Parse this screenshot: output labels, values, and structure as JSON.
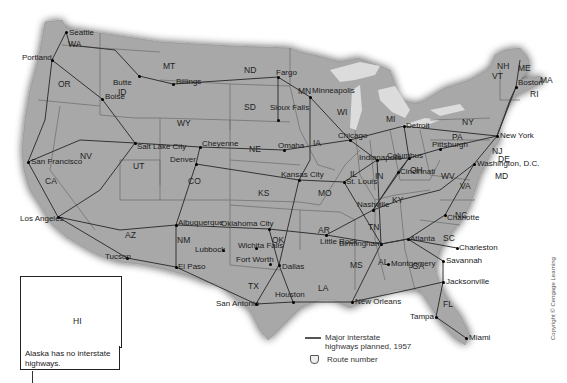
{
  "map": {
    "title": "Major interstate highways planned, 1957",
    "land_color": "#a8a8a8",
    "water_color": "#ffffff",
    "lakes_color": "#d8d8d8",
    "road_color": "#3a3a3a",
    "border_color": "#6a6a6a",
    "states": [
      {
        "abbr": "WA",
        "x": 68,
        "y": 40
      },
      {
        "abbr": "OR",
        "x": 58,
        "y": 80
      },
      {
        "abbr": "ID",
        "x": 118,
        "y": 88
      },
      {
        "abbr": "MT",
        "x": 163,
        "y": 62
      },
      {
        "abbr": "WY",
        "x": 177,
        "y": 119
      },
      {
        "abbr": "ND",
        "x": 244,
        "y": 66
      },
      {
        "abbr": "SD",
        "x": 244,
        "y": 103
      },
      {
        "abbr": "MN",
        "x": 298,
        "y": 87
      },
      {
        "abbr": "WI",
        "x": 337,
        "y": 108
      },
      {
        "abbr": "MI",
        "x": 386,
        "y": 115
      },
      {
        "abbr": "NV",
        "x": 80,
        "y": 152
      },
      {
        "abbr": "UT",
        "x": 133,
        "y": 162
      },
      {
        "abbr": "CO",
        "x": 188,
        "y": 177
      },
      {
        "abbr": "NE",
        "x": 249,
        "y": 145
      },
      {
        "abbr": "IA",
        "x": 313,
        "y": 139
      },
      {
        "abbr": "KS",
        "x": 258,
        "y": 189
      },
      {
        "abbr": "MO",
        "x": 318,
        "y": 189
      },
      {
        "abbr": "IL",
        "x": 350,
        "y": 170
      },
      {
        "abbr": "IN",
        "x": 375,
        "y": 172
      },
      {
        "abbr": "OH",
        "x": 410,
        "y": 166
      },
      {
        "abbr": "PA",
        "x": 452,
        "y": 133
      },
      {
        "abbr": "NY",
        "x": 462,
        "y": 118
      },
      {
        "abbr": "CA",
        "x": 45,
        "y": 177
      },
      {
        "abbr": "AZ",
        "x": 125,
        "y": 231
      },
      {
        "abbr": "NM",
        "x": 177,
        "y": 236
      },
      {
        "abbr": "OK",
        "x": 272,
        "y": 236
      },
      {
        "abbr": "TX",
        "x": 248,
        "y": 282
      },
      {
        "abbr": "AR",
        "x": 318,
        "y": 226
      },
      {
        "abbr": "LA",
        "x": 318,
        "y": 284
      },
      {
        "abbr": "MS",
        "x": 350,
        "y": 261
      },
      {
        "abbr": "AL",
        "x": 378,
        "y": 258
      },
      {
        "abbr": "GA",
        "x": 412,
        "y": 262
      },
      {
        "abbr": "TN",
        "x": 368,
        "y": 223
      },
      {
        "abbr": "KY",
        "x": 392,
        "y": 196
      },
      {
        "abbr": "WV",
        "x": 441,
        "y": 172
      },
      {
        "abbr": "VA",
        "x": 460,
        "y": 182
      },
      {
        "abbr": "NC",
        "x": 455,
        "y": 211
      },
      {
        "abbr": "SC",
        "x": 443,
        "y": 234
      },
      {
        "abbr": "FL",
        "x": 443,
        "y": 300
      },
      {
        "abbr": "NJ",
        "x": 492,
        "y": 147
      },
      {
        "abbr": "DE",
        "x": 498,
        "y": 155
      },
      {
        "abbr": "MD",
        "x": 495,
        "y": 172
      },
      {
        "abbr": "VT",
        "x": 492,
        "y": 72
      },
      {
        "abbr": "NH",
        "x": 497,
        "y": 62
      },
      {
        "abbr": "ME",
        "x": 518,
        "y": 64
      },
      {
        "abbr": "MA",
        "x": 540,
        "y": 76
      },
      {
        "abbr": "RI",
        "x": 530,
        "y": 90
      },
      {
        "abbr": "HI",
        "x": 73,
        "y": 321
      }
    ],
    "cities": [
      {
        "name": "Seattle",
        "x": 66,
        "y": 32,
        "dx": 3,
        "dy": -3
      },
      {
        "name": "Portland",
        "x": 52,
        "y": 60,
        "dx": -30,
        "dy": -6
      },
      {
        "name": "Boise",
        "x": 102,
        "y": 99,
        "dx": 3,
        "dy": -6
      },
      {
        "name": "Butte",
        "x": 139,
        "y": 76,
        "dx": -26,
        "dy": 3
      },
      {
        "name": "Billings",
        "x": 173,
        "y": 84,
        "dx": 3,
        "dy": -6
      },
      {
        "name": "Fargo",
        "x": 278,
        "y": 77,
        "dx": -2,
        "dy": -8
      },
      {
        "name": "Minneapolis",
        "x": 310,
        "y": 97,
        "dx": 2,
        "dy": -10
      },
      {
        "name": "Sioux Falls",
        "x": 278,
        "y": 120,
        "dx": -8,
        "dy": -16
      },
      {
        "name": "Salt Lake City",
        "x": 135,
        "y": 143,
        "dx": 2,
        "dy": 0
      },
      {
        "name": "Cheyenne",
        "x": 200,
        "y": 147,
        "dx": 2,
        "dy": -7
      },
      {
        "name": "Omaha",
        "x": 284,
        "y": 150,
        "dx": -6,
        "dy": -8
      },
      {
        "name": "Denver",
        "x": 196,
        "y": 164,
        "dx": -26,
        "dy": -8
      },
      {
        "name": "San Francisco",
        "x": 28,
        "y": 162,
        "dx": 3,
        "dy": -4
      },
      {
        "name": "Kansas City",
        "x": 299,
        "y": 180,
        "dx": -18,
        "dy": -9
      },
      {
        "name": "Chicago",
        "x": 350,
        "y": 140,
        "dx": -12,
        "dy": -8
      },
      {
        "name": "Detroit",
        "x": 404,
        "y": 126,
        "dx": 2,
        "dy": -4
      },
      {
        "name": "Indianapolis",
        "x": 377,
        "y": 160,
        "dx": -18,
        "dy": -6
      },
      {
        "name": "Columbus",
        "x": 409,
        "y": 158,
        "dx": -22,
        "dy": -6
      },
      {
        "name": "Cincinnati",
        "x": 398,
        "y": 172,
        "dx": 2,
        "dy": -4
      },
      {
        "name": "St. Louis",
        "x": 344,
        "y": 182,
        "dx": 2,
        "dy": -4
      },
      {
        "name": "Pittsburgh",
        "x": 440,
        "y": 149,
        "dx": -8,
        "dy": -8
      },
      {
        "name": "New York",
        "x": 497,
        "y": 136,
        "dx": 3,
        "dy": -4
      },
      {
        "name": "Boston",
        "x": 516,
        "y": 87,
        "dx": 2,
        "dy": -8
      },
      {
        "name": "Washington, D.C.",
        "x": 474,
        "y": 164,
        "dx": 3,
        "dy": -4
      },
      {
        "name": "Los Angeles",
        "x": 58,
        "y": 217,
        "dx": -38,
        "dy": -2
      },
      {
        "name": "Albuquerque",
        "x": 176,
        "y": 225,
        "dx": 2,
        "dy": -6
      },
      {
        "name": "Oklahoma City",
        "x": 269,
        "y": 229,
        "dx": -48,
        "dy": -9
      },
      {
        "name": "Nashville",
        "x": 373,
        "y": 210,
        "dx": -16,
        "dy": -9
      },
      {
        "name": "Charlotte",
        "x": 445,
        "y": 215,
        "dx": 2,
        "dy": -1
      },
      {
        "name": "Tucson",
        "x": 127,
        "y": 258,
        "dx": -22,
        "dy": -5
      },
      {
        "name": "Lubbock",
        "x": 223,
        "y": 250,
        "dx": -28,
        "dy": -4
      },
      {
        "name": "Wichita Falls",
        "x": 256,
        "y": 248,
        "dx": -18,
        "dy": -6
      },
      {
        "name": "Little Rock",
        "x": 326,
        "y": 235,
        "dx": -6,
        "dy": 3
      },
      {
        "name": "Birmingham",
        "x": 381,
        "y": 244,
        "dx": -42,
        "dy": -4
      },
      {
        "name": "Atlanta",
        "x": 408,
        "y": 239,
        "dx": 2,
        "dy": -4
      },
      {
        "name": "Charleston",
        "x": 457,
        "y": 248,
        "dx": 2,
        "dy": -4
      },
      {
        "name": "El Paso",
        "x": 176,
        "y": 267,
        "dx": 2,
        "dy": -4
      },
      {
        "name": "Fort Worth",
        "x": 270,
        "y": 264,
        "dx": -34,
        "dy": -8
      },
      {
        "name": "Dallas",
        "x": 279,
        "y": 265,
        "dx": 3,
        "dy": -2
      },
      {
        "name": "Montgomery",
        "x": 388,
        "y": 264,
        "dx": 3,
        "dy": -4
      },
      {
        "name": "Savannah",
        "x": 443,
        "y": 261,
        "dx": 3,
        "dy": -4
      },
      {
        "name": "Jacksonville",
        "x": 443,
        "y": 282,
        "dx": 3,
        "dy": -4
      },
      {
        "name": "San Antonio",
        "x": 256,
        "y": 304,
        "dx": -40,
        "dy": -4
      },
      {
        "name": "Houston",
        "x": 293,
        "y": 302,
        "dx": -18,
        "dy": -11
      },
      {
        "name": "New Orleans",
        "x": 352,
        "y": 302,
        "dx": 3,
        "dy": -4
      },
      {
        "name": "Tampa",
        "x": 436,
        "y": 317,
        "dx": -26,
        "dy": -4
      },
      {
        "name": "Miami",
        "x": 466,
        "y": 338,
        "dx": 3,
        "dy": -4
      },
      {
        "name": "Honolulu",
        "x": 66,
        "y": 297,
        "dx": 3,
        "dy": -4
      }
    ]
  },
  "inset": {
    "label": "HI",
    "note": "Alaska has no interstate highways."
  },
  "legend": {
    "highway_label": "Major interstate highways planned, 1957",
    "route_label": "Route number",
    "highway_icon": "highway-line-icon",
    "route_icon": "route-shield-icon"
  },
  "copyright": "Copyright © Cengage Learning"
}
